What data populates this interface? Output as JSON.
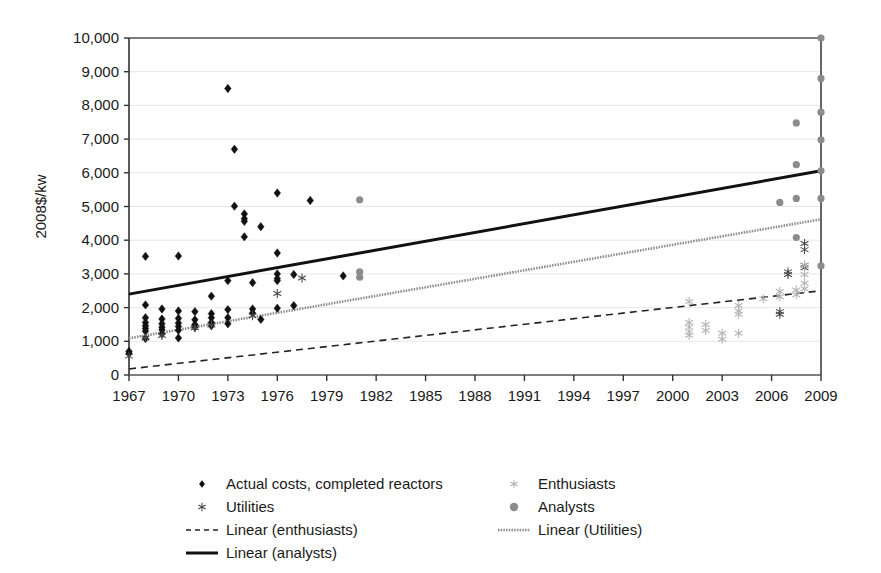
{
  "chart_data": {
    "type": "scatter",
    "title": "",
    "xlabel": "",
    "ylabel": "2008$/kw",
    "xlim": [
      1967,
      2009
    ],
    "ylim": [
      0,
      10000
    ],
    "grid": true,
    "legend_position": "bottom",
    "x_ticks": [
      1967,
      1970,
      1973,
      1976,
      1979,
      1982,
      1985,
      1988,
      1991,
      1994,
      1997,
      2000,
      2003,
      2006,
      2009
    ],
    "x_tick_labels": [
      "1967",
      "1970",
      "1973",
      "1976",
      "1979",
      "1982",
      "1985",
      "1988",
      "1991",
      "1994",
      "1997",
      "2000",
      "2003",
      "2006",
      "2009"
    ],
    "y_ticks": [
      0,
      1000,
      2000,
      3000,
      4000,
      5000,
      6000,
      7000,
      8000,
      9000,
      10000
    ],
    "y_tick_labels": [
      "0",
      "1,000",
      "2,000",
      "3,000",
      "4,000",
      "5,000",
      "6,000",
      "7,000",
      "8,000",
      "9,000",
      "10,000"
    ],
    "series": [
      {
        "name": "Actual costs, completed reactors",
        "marker": "diamond",
        "color": "#111111",
        "size": 4.2,
        "points": [
          [
            1967,
            700
          ],
          [
            1967,
            640
          ],
          [
            1968,
            3520
          ],
          [
            1968,
            2080
          ],
          [
            1968,
            1700
          ],
          [
            1968,
            1560
          ],
          [
            1968,
            1460
          ],
          [
            1968,
            1380
          ],
          [
            1968,
            1300
          ],
          [
            1968,
            1080
          ],
          [
            1969,
            1960
          ],
          [
            1969,
            1660
          ],
          [
            1969,
            1520
          ],
          [
            1969,
            1420
          ],
          [
            1969,
            1340
          ],
          [
            1969,
            1220
          ],
          [
            1970,
            3530
          ],
          [
            1970,
            1900
          ],
          [
            1970,
            1680
          ],
          [
            1970,
            1540
          ],
          [
            1970,
            1440
          ],
          [
            1970,
            1330
          ],
          [
            1970,
            1100
          ],
          [
            1971,
            1880
          ],
          [
            1971,
            1640
          ],
          [
            1971,
            1500
          ],
          [
            1971,
            1420
          ],
          [
            1972,
            2340
          ],
          [
            1972,
            1820
          ],
          [
            1972,
            1700
          ],
          [
            1972,
            1560
          ],
          [
            1972,
            1460
          ],
          [
            1973,
            8500
          ],
          [
            1973,
            2800
          ],
          [
            1973,
            1940
          ],
          [
            1973,
            1700
          ],
          [
            1973,
            1520
          ],
          [
            1973.4,
            6700
          ],
          [
            1973.4,
            5010
          ],
          [
            1974,
            4780
          ],
          [
            1974,
            4640
          ],
          [
            1974,
            4560
          ],
          [
            1974,
            4100
          ],
          [
            1974.5,
            2740
          ],
          [
            1974.5,
            1960
          ],
          [
            1974.5,
            1840
          ],
          [
            1975,
            4400
          ],
          [
            1975,
            1650
          ],
          [
            1976,
            5400
          ],
          [
            1976,
            3620
          ],
          [
            1976,
            3000
          ],
          [
            1976,
            2860
          ],
          [
            1976,
            2800
          ],
          [
            1976,
            1980
          ],
          [
            1977,
            2980
          ],
          [
            1977,
            2060
          ],
          [
            1978,
            5180
          ],
          [
            1980,
            2940
          ]
        ]
      },
      {
        "name": "Utilities",
        "marker": "asterisk",
        "color": "#4a4a4a",
        "size": 4.5,
        "points": [
          [
            1967,
            560
          ],
          [
            1968,
            1100
          ],
          [
            1969,
            1170
          ],
          [
            1971,
            1400
          ],
          [
            1972,
            1480
          ],
          [
            1974.5,
            1760
          ],
          [
            1976,
            2420
          ],
          [
            1977.5,
            2880
          ],
          [
            2006.5,
            1880
          ],
          [
            2006.5,
            1800
          ],
          [
            2007,
            3060
          ],
          [
            2007,
            2980
          ],
          [
            2008,
            3900
          ],
          [
            2008,
            3720
          ],
          [
            2008,
            3260
          ],
          [
            2008,
            3180
          ]
        ]
      },
      {
        "name": "Enthusiasts",
        "marker": "asterisk",
        "color": "#b4b4b4",
        "size": 4.5,
        "points": [
          [
            2001,
            2180
          ],
          [
            2001,
            1560
          ],
          [
            2001,
            1420
          ],
          [
            2001,
            1280
          ],
          [
            2001,
            1180
          ],
          [
            2002,
            1500
          ],
          [
            2002,
            1320
          ],
          [
            2003,
            1240
          ],
          [
            2003,
            1060
          ],
          [
            2004,
            2060
          ],
          [
            2004,
            1900
          ],
          [
            2004,
            1800
          ],
          [
            2004,
            1240
          ],
          [
            2005.5,
            2260
          ],
          [
            2006.5,
            2480
          ],
          [
            2006.5,
            2320
          ],
          [
            2007.5,
            2520
          ],
          [
            2007.5,
            2380
          ],
          [
            2008,
            3260
          ],
          [
            2008,
            2980
          ],
          [
            2008,
            2720
          ],
          [
            2008,
            2560
          ]
        ]
      },
      {
        "name": "Analysts",
        "marker": "circle",
        "color": "#8c8c8c",
        "size": 3.6,
        "points": [
          [
            1981,
            5200
          ],
          [
            1981,
            3060
          ],
          [
            1981,
            2900
          ],
          [
            2006.5,
            5120
          ],
          [
            2007.5,
            7480
          ],
          [
            2007.5,
            6240
          ],
          [
            2007.5,
            5240
          ],
          [
            2007.5,
            4080
          ],
          [
            2009,
            10000
          ],
          [
            2009,
            8800
          ],
          [
            2009,
            7800
          ],
          [
            2009,
            6980
          ],
          [
            2009,
            6060
          ],
          [
            2009,
            5240
          ],
          [
            2009,
            3240
          ]
        ]
      }
    ],
    "trendlines": [
      {
        "name": "Linear (enthusiasts)",
        "style": "dashed",
        "color": "#222222",
        "width": 1.6,
        "x0": 1967,
        "y0": 180,
        "x1": 2009,
        "y1": 2500
      },
      {
        "name": "Linear (Utilities)",
        "style": "solid-gray",
        "color": "#8c8c8c",
        "width": 2.6,
        "x0": 1967,
        "y0": 1090,
        "x1": 2009,
        "y1": 4620
      },
      {
        "name": "Linear (analysts)",
        "style": "solid",
        "color": "#111111",
        "width": 3.0,
        "x0": 1967,
        "y0": 2400,
        "x1": 2009,
        "y1": 6060
      }
    ],
    "legend": [
      {
        "label": "Actual costs, completed reactors",
        "kind": "marker",
        "marker": "diamond",
        "color": "#111111",
        "col": 0,
        "row": 0
      },
      {
        "label": "Utilities",
        "kind": "marker",
        "marker": "asterisk",
        "color": "#4a4a4a",
        "col": 0,
        "row": 1
      },
      {
        "label": "Linear (enthusiasts)",
        "kind": "line",
        "style": "dashed",
        "color": "#222222",
        "col": 0,
        "row": 2
      },
      {
        "label": "Linear (analysts)",
        "kind": "line",
        "style": "solid",
        "color": "#111111",
        "col": 0,
        "row": 3
      },
      {
        "label": "Enthusiasts",
        "kind": "marker",
        "marker": "asterisk",
        "color": "#b4b4b4",
        "col": 1,
        "row": 0
      },
      {
        "label": "Analysts",
        "kind": "marker",
        "marker": "circle",
        "color": "#8c8c8c",
        "col": 1,
        "row": 1
      },
      {
        "label": "Linear (Utilities)",
        "kind": "line",
        "style": "solid-gray",
        "color": "#8c8c8c",
        "col": 1,
        "row": 2
      }
    ],
    "colors": {
      "axis": "#555555",
      "grid": "#e8e8e8",
      "background": "#ffffff",
      "actual": "#111111",
      "utilities": "#4a4a4a",
      "enthusiasts": "#b4b4b4",
      "analysts": "#8c8c8c"
    }
  }
}
